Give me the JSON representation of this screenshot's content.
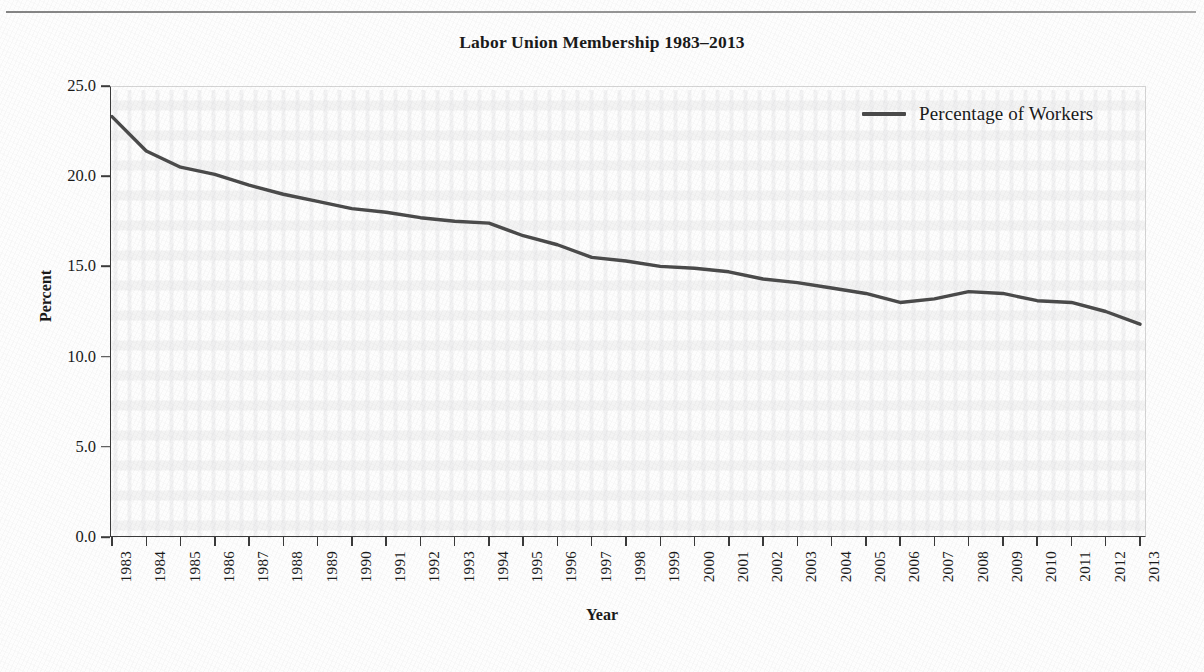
{
  "figure": {
    "title": "Labor Union Membership 1983–2013",
    "line_color": "#4a4a4a",
    "axis_color": "#3a3a3a"
  },
  "legend": {
    "position": "top-right",
    "entries": [
      {
        "label": "Percentage of Workers",
        "swatch": "line-swatch"
      }
    ]
  },
  "axes": {
    "x_title": "Year",
    "y_title": "Percent",
    "y_ticks": [
      "0.0",
      "5.0",
      "10.0",
      "15.0",
      "20.0",
      "25.0"
    ],
    "x_ticks": [
      "1983",
      "1984",
      "1985",
      "1986",
      "1987",
      "1988",
      "1989",
      "1990",
      "1991",
      "1992",
      "1993",
      "1994",
      "1995",
      "1996",
      "1997",
      "1998",
      "1999",
      "2000",
      "2001",
      "2002",
      "2003",
      "2004",
      "2005",
      "2006",
      "2007",
      "2008",
      "2009",
      "2010",
      "2011",
      "2012",
      "2013"
    ]
  },
  "chart_data": {
    "type": "line",
    "title": "Labor Union Membership 1983–2013",
    "xlabel": "Year",
    "ylabel": "Percent",
    "ylim": [
      0.0,
      25.0
    ],
    "xlim": [
      "1983",
      "2013"
    ],
    "grid": false,
    "legend_position": "top-right",
    "x": [
      "1983",
      "1984",
      "1985",
      "1986",
      "1987",
      "1988",
      "1989",
      "1990",
      "1991",
      "1992",
      "1993",
      "1994",
      "1995",
      "1996",
      "1997",
      "1998",
      "1999",
      "2000",
      "2001",
      "2002",
      "2003",
      "2004",
      "2005",
      "2006",
      "2007",
      "2008",
      "2009",
      "2010",
      "2011",
      "2012",
      "2013"
    ],
    "series": [
      {
        "name": "Percentage of Workers",
        "color": "#4a4a4a",
        "values": [
          23.3,
          21.4,
          20.5,
          20.1,
          19.5,
          19.0,
          18.6,
          18.2,
          18.0,
          17.7,
          17.5,
          17.4,
          16.7,
          16.2,
          15.5,
          15.3,
          15.0,
          14.9,
          14.7,
          14.3,
          14.1,
          13.8,
          13.5,
          13.0,
          13.2,
          13.6,
          13.5,
          13.1,
          13.0,
          12.5,
          11.8
        ]
      }
    ]
  }
}
